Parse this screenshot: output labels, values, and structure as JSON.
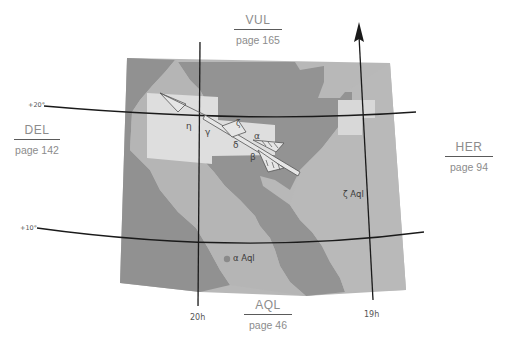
{
  "navigation": {
    "north": {
      "abbr": "VUL",
      "page": "page 165"
    },
    "west": {
      "abbr": "DEL",
      "page": "page 142"
    },
    "east": {
      "abbr": "HER",
      "page": "page 94"
    },
    "south": {
      "abbr": "AQL",
      "page": "page 46"
    }
  },
  "grid": {
    "dec_lines": [
      "+20°",
      "+10°"
    ],
    "ra_lines": [
      "20h",
      "19h"
    ]
  },
  "constellation": {
    "name": "Sagitta",
    "stars": [
      "η",
      "γ",
      "ζ",
      "α",
      "δ",
      "β"
    ]
  },
  "labels": {
    "alpha_aql": "α Aql",
    "zeta_aql": "ζ Aql"
  },
  "colors": {
    "background": "#ffffff",
    "region_light": "#dcdcdc",
    "region_mid": "#b4b4b4",
    "region_dark": "#8f8f8f",
    "grid_line": "#1a1a1a",
    "nav_text": "#8c8c8c",
    "star_dot": "#8a8a8a"
  }
}
